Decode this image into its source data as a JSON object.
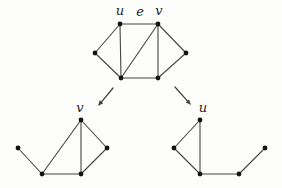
{
  "figure": {
    "width": 282,
    "height": 188
  },
  "colors": {
    "background": "#fdfdfc",
    "edge": "#454545",
    "vertex": "#131313",
    "label": "#242424",
    "arrow": "#3d3d3d"
  },
  "style": {
    "vertex_radius": 2.4,
    "edge_width": 1.1,
    "arrow_width": 1.2,
    "arrow_head_length": 5.5,
    "arrow_head_halfwidth": 2.2
  },
  "graphs": [
    {
      "id": "top-graph",
      "vertices": [
        {
          "id": "left",
          "x": 95,
          "y": 53
        },
        {
          "id": "u",
          "x": 120,
          "y": 24
        },
        {
          "id": "v",
          "x": 158,
          "y": 24
        },
        {
          "id": "right",
          "x": 186,
          "y": 53
        },
        {
          "id": "bl",
          "x": 121,
          "y": 78
        },
        {
          "id": "br",
          "x": 158,
          "y": 78
        }
      ],
      "edges": [
        [
          "left",
          "u"
        ],
        [
          "left",
          "bl"
        ],
        [
          "u",
          "v"
        ],
        [
          "u",
          "bl"
        ],
        [
          "bl",
          "v"
        ],
        [
          "bl",
          "br"
        ],
        [
          "v",
          "br"
        ],
        [
          "v",
          "right"
        ],
        [
          "br",
          "right"
        ]
      ],
      "labels": [
        {
          "text": "u",
          "x": 120,
          "y": 15
        },
        {
          "text": "e",
          "x": 140,
          "y": 16
        },
        {
          "text": "v",
          "x": 159,
          "y": 15
        }
      ]
    },
    {
      "id": "left-subgraph",
      "vertices": [
        {
          "id": "far-left",
          "x": 18,
          "y": 148
        },
        {
          "id": "v",
          "x": 81,
          "y": 120
        },
        {
          "id": "right",
          "x": 107,
          "y": 148
        },
        {
          "id": "bl",
          "x": 42,
          "y": 174
        },
        {
          "id": "bm",
          "x": 81,
          "y": 174
        }
      ],
      "edges": [
        [
          "far-left",
          "bl"
        ],
        [
          "bl",
          "v"
        ],
        [
          "bl",
          "bm"
        ],
        [
          "bm",
          "v"
        ],
        [
          "v",
          "right"
        ],
        [
          "right",
          "bm"
        ]
      ],
      "labels": [
        {
          "text": "v",
          "x": 80,
          "y": 112
        }
      ]
    },
    {
      "id": "right-subgraph",
      "vertices": [
        {
          "id": "left",
          "x": 174,
          "y": 148
        },
        {
          "id": "u",
          "x": 200,
          "y": 120
        },
        {
          "id": "bl",
          "x": 200,
          "y": 174
        },
        {
          "id": "bm",
          "x": 239,
          "y": 174
        },
        {
          "id": "right",
          "x": 265,
          "y": 148
        }
      ],
      "edges": [
        [
          "left",
          "u"
        ],
        [
          "left",
          "bl"
        ],
        [
          "u",
          "bl"
        ],
        [
          "bl",
          "bm"
        ],
        [
          "bm",
          "right"
        ]
      ],
      "labels": [
        {
          "text": "u",
          "x": 203,
          "y": 112
        }
      ]
    }
  ],
  "arrows": [
    {
      "id": "arrow-to-left-subgraph",
      "x1": 113,
      "y1": 88,
      "x2": 98,
      "y2": 106
    },
    {
      "id": "arrow-to-right-subgraph",
      "x1": 175,
      "y1": 87,
      "x2": 191,
      "y2": 105
    }
  ]
}
